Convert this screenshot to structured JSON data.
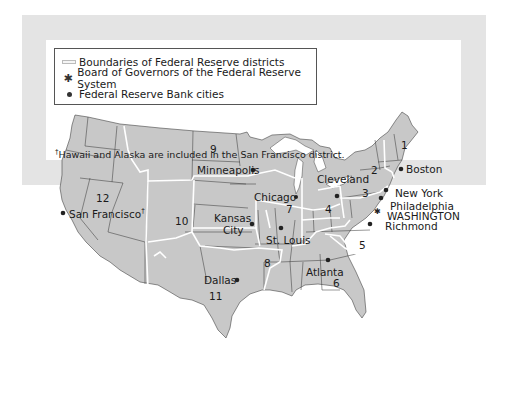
{
  "legend": {
    "items": [
      {
        "symbol": "boundary-line",
        "label": "Boundaries of Federal Reserve districts"
      },
      {
        "symbol": "asterisk",
        "label": "Board of Governors of the Federal Reserve System"
      },
      {
        "symbol": "dot",
        "label": "Federal Reserve Bank cities"
      }
    ]
  },
  "districts": [
    {
      "number": "1",
      "city": "Boston"
    },
    {
      "number": "2",
      "city": "New York"
    },
    {
      "number": "3",
      "city": "Philadelphia"
    },
    {
      "number": "4",
      "city": "Cleveland"
    },
    {
      "number": "5",
      "city": "Richmond"
    },
    {
      "number": "6",
      "city": "Atlanta"
    },
    {
      "number": "7",
      "city": "Chicago"
    },
    {
      "number": "8",
      "city": "St. Louis"
    },
    {
      "number": "9",
      "city": "Minneapolis"
    },
    {
      "number": "10",
      "city": "Kansas City"
    },
    {
      "number": "11",
      "city": "Dallas"
    },
    {
      "number": "12",
      "city": "San Francisco"
    }
  ],
  "cities": {
    "boston": "Boston",
    "new_york": "New York",
    "philadelphia": "Philadelphia",
    "washington": "WASHINGTON",
    "richmond": "Richmond",
    "cleveland": "Cleveland",
    "chicago": "Chicago",
    "minneapolis": "Minneapolis",
    "kansas": "Kansas",
    "city": "City",
    "st_louis": "St. Louis",
    "atlanta": "Atlanta",
    "dallas": "Dallas",
    "san_francisco": "San Francisco",
    "dagger": "†"
  },
  "numbers": {
    "d1": "1",
    "d2": "2",
    "d3": "3",
    "d4": "4",
    "d5": "5",
    "d6": "6",
    "d7": "7",
    "d8": "8",
    "d9": "9",
    "d10": "10",
    "d11": "11",
    "d12": "12"
  },
  "footnote": {
    "dagger": "†",
    "text": "Hawaii and Alaska are included in the San Francisco district."
  },
  "colors": {
    "frame": "#e4e4e4",
    "land": "#c8c8c8",
    "boundary": "#ffffff",
    "state_line": "#333333"
  }
}
